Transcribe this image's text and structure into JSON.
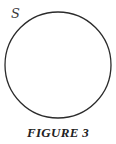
{
  "figure": {
    "set_label": "S",
    "caption": "FIGURE 3",
    "circle": {
      "cx": 58,
      "cy": 65,
      "r": 53,
      "stroke": "#2b2b2b",
      "stroke_width": 1.3,
      "fill": "none"
    }
  }
}
